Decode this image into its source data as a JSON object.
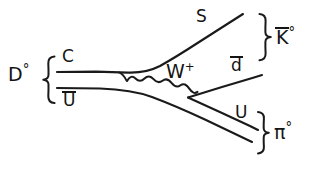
{
  "diagram": {
    "type": "feynman-diagram",
    "background_color": "#ffffff",
    "ink_color": "#1a1a1a",
    "initial_state": {
      "name": "D-zero meson",
      "label_base": "D",
      "label_superscript": "°",
      "brace": "{",
      "constituents": [
        {
          "label": "C",
          "overbar": false,
          "name": "charm-quark"
        },
        {
          "label": "U",
          "overbar": true,
          "name": "anti-up-quark"
        }
      ]
    },
    "mediator": {
      "label_base": "W",
      "label_superscript": "+",
      "name": "w-boson-propagator",
      "style": "wavy"
    },
    "final_states": [
      {
        "name": "anti-k-zero-meson",
        "label_base": "K",
        "label_overbar": true,
        "label_superscript": "°",
        "brace": "}",
        "constituents": [
          {
            "label": "S",
            "overbar": false,
            "name": "strange-quark"
          },
          {
            "label": "d",
            "overbar": true,
            "name": "anti-down-quark"
          }
        ]
      },
      {
        "name": "pi-zero-meson",
        "label_base": "π",
        "label_overbar": false,
        "label_superscript": "°",
        "brace": "}",
        "constituents": [
          {
            "label": "U",
            "overbar": false,
            "name": "up-quark"
          },
          {
            "label": "U",
            "overbar": true,
            "name": "anti-up-quark-spectator"
          }
        ]
      }
    ]
  },
  "labels": {
    "d_meson_base": "D",
    "d_meson_sup": "°",
    "left_brace": "{",
    "charm": "C",
    "antiup_in": "U",
    "strange": "S",
    "w_base": "W",
    "w_sup": "+",
    "antidown": "d",
    "up_out": "U",
    "kbar_base": "K",
    "kbar_sup": "°",
    "kbar_brace": "}",
    "pi_base": "π",
    "pi_sup": "°",
    "pi_brace": "}"
  }
}
